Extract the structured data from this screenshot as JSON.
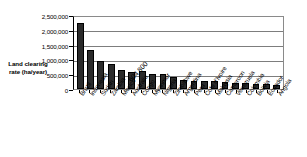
{
  "chart_data": {
    "type": "bar",
    "title": "",
    "xlabel": "",
    "ylabel": "Land clearing rate (ha/year)",
    "ylim": [
      0,
      2500000
    ],
    "yticks": [
      0,
      500000,
      1000000,
      1500000,
      2000000,
      2500000
    ],
    "ytick_labels": [
      "0",
      "500,000",
      "1,000,000",
      "1,500,000",
      "2,000,000",
      "2,500,000"
    ],
    "grid": true,
    "legend": null,
    "categories": [
      "Brazil",
      "Indonesia",
      "Sudan",
      "Zambia",
      "Mexico",
      "Australia",
      "Congo",
      "Myanmar",
      "Nigeria",
      "Zimbabwe",
      "Argentina",
      "Peru",
      "Cote d'Ivoire",
      "Malaysia",
      "Cameroon",
      "Venezuela",
      "Colombia",
      "Bolivia",
      "Ecuador",
      "Angola"
    ],
    "values": [
      2230000,
      1315000,
      960000,
      850000,
      630000,
      565000,
      604800,
      520000,
      510000,
      400000,
      300000,
      285000,
      275000,
      270000,
      240000,
      215000,
      210000,
      170000,
      160000,
      125000
    ],
    "annotations": [
      {
        "text": "604,800",
        "category": "Congo",
        "value": 604800
      }
    ],
    "bar_color": "#2b2b2b"
  }
}
